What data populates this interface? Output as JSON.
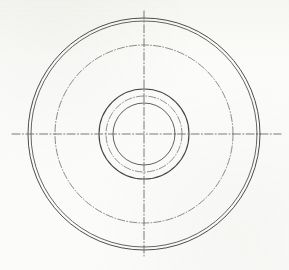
{
  "drawing": {
    "title": "Circular Flange Part View",
    "view_label": "front-view",
    "background_color": "#fbfbf9",
    "line_color": "#4a4a4a",
    "centerline_color": "#6b6b6b",
    "canvas": {
      "width": 289,
      "height": 270
    },
    "center": {
      "x": 144,
      "y": 134
    },
    "circles": [
      {
        "name": "outer-rim-outer-circle",
        "style": "solid",
        "radius": 116,
        "stroke_width": 1.0,
        "color": "#4d4d4d"
      },
      {
        "name": "outer-rim-inner-circle",
        "style": "solid",
        "radius": 113,
        "stroke_width": 0.9,
        "color": "#555555"
      },
      {
        "name": "bolt-circle",
        "style": "dash-dot",
        "radius": 89,
        "stroke_width": 0.8,
        "color": "#707070"
      },
      {
        "name": "hub-outer-circle",
        "style": "solid",
        "radius": 45,
        "stroke_width": 1.1,
        "color": "#454545"
      },
      {
        "name": "hub-reference-circle",
        "style": "dash-dot",
        "radius": 38,
        "stroke_width": 0.8,
        "color": "#767676"
      },
      {
        "name": "hub-bore-circle",
        "style": "solid",
        "radius": 31,
        "stroke_width": 0.9,
        "color": "#4f4f4f"
      }
    ],
    "centerlines": [
      {
        "name": "horizontal-centerline",
        "orientation": "horizontal",
        "x1": 12,
        "y1": 134,
        "x2": 281,
        "y2": 134,
        "style": "dash-dot",
        "stroke_width": 0.9,
        "color": "#6b6b6b"
      },
      {
        "name": "vertical-centerline",
        "orientation": "vertical",
        "x1": 144,
        "y1": 11,
        "x2": 144,
        "y2": 256,
        "style": "dash-dot",
        "stroke_width": 0.9,
        "color": "#6b6b6b"
      }
    ],
    "annotations": []
  }
}
